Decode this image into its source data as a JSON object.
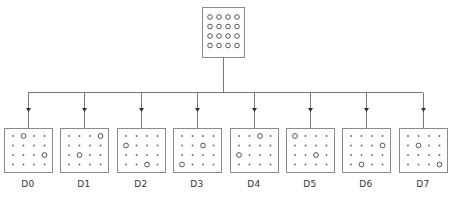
{
  "diagram": {
    "colors": {
      "line": "#777777",
      "box": "#8a8a8a",
      "dot": "#666666",
      "circle": "#555555",
      "background": "#ffffff"
    },
    "source": {
      "name": "source-array",
      "grid": {
        "rows": 4,
        "cols": 4
      },
      "cells": "all-circles"
    },
    "devices": [
      {
        "label": "D0",
        "highlighted": [
          [
            0,
            1
          ],
          [
            2,
            3
          ]
        ]
      },
      {
        "label": "D1",
        "highlighted": [
          [
            0,
            3
          ],
          [
            2,
            1
          ]
        ]
      },
      {
        "label": "D2",
        "highlighted": [
          [
            1,
            0
          ],
          [
            3,
            2
          ]
        ]
      },
      {
        "label": "D3",
        "highlighted": [
          [
            1,
            2
          ],
          [
            3,
            0
          ]
        ]
      },
      {
        "label": "D4",
        "highlighted": [
          [
            0,
            2
          ],
          [
            2,
            0
          ]
        ]
      },
      {
        "label": "D5",
        "highlighted": [
          [
            0,
            0
          ],
          [
            2,
            2
          ]
        ]
      },
      {
        "label": "D6",
        "highlighted": [
          [
            1,
            3
          ],
          [
            3,
            1
          ]
        ]
      },
      {
        "label": "D7",
        "highlighted": [
          [
            1,
            1
          ],
          [
            3,
            3
          ]
        ]
      }
    ]
  },
  "caption": ""
}
